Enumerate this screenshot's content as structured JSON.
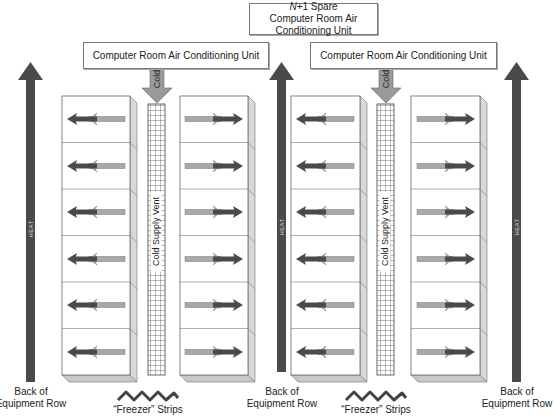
{
  "diagram": {
    "type": "hot-aisle/cold-aisle data center cooling layout",
    "spare_unit": {
      "prefix": "N",
      "suffix": "+1 Spare",
      "label": "Computer Room Air Conditioning Unit"
    },
    "crac_units": [
      {
        "label": "Computer Room Air Conditioning Unit",
        "cold_label": "Cold"
      },
      {
        "label": "Computer Room Air Conditioning Unit",
        "cold_label": "Cold"
      }
    ],
    "heat_arrows": [
      {
        "label": "HEAT",
        "caption_line1": "Back of",
        "caption_line2": "Equipment Row"
      },
      {
        "label": "HEAT",
        "caption_line1": "Back of",
        "caption_line2": "Equipment Row"
      },
      {
        "label": "HEAT",
        "caption_line1": "Back of",
        "caption_line2": "Equipment Row"
      }
    ],
    "cold_vents": [
      {
        "label": "Cold Supply Vent",
        "freezer_label": "“Freezer” Strips"
      },
      {
        "label": "Cold Supply Vent",
        "freezer_label": "“Freezer” Strips"
      }
    ],
    "rack_rows": [
      {
        "side": "left-of-vent-1",
        "units": 6,
        "airflow": "right-to-left"
      },
      {
        "side": "right-of-vent-1",
        "units": 6,
        "airflow": "left-to-right"
      },
      {
        "side": "left-of-vent-2",
        "units": 6,
        "airflow": "right-to-left"
      },
      {
        "side": "right-of-vent-2",
        "units": 6,
        "airflow": "left-to-right"
      }
    ],
    "colors": {
      "heat_arrow": "#4a4a4a",
      "cold_arrow": "#9a9a9a",
      "hot_exhaust": "#555555",
      "cool_intake": "#a8a8a8",
      "rack_side": "#d8d8d8",
      "rack_bottom": "#c8c8c8"
    }
  }
}
